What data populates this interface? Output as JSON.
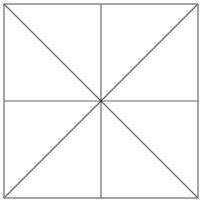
{
  "diagram": {
    "type": "square-subdivision",
    "canvas": {
      "width": 207,
      "height": 205,
      "background": "#ffffff"
    },
    "square": {
      "x": 4,
      "y": 4,
      "size": 194
    },
    "center": {
      "x": 101,
      "y": 101
    },
    "stroke_color": "#6a6a6a",
    "stroke_width": 1.2,
    "lines": [
      {
        "name": "diagonal-tl-br",
        "x1": 4,
        "y1": 4,
        "x2": 198,
        "y2": 198
      },
      {
        "name": "diagonal-tr-bl",
        "x1": 198,
        "y1": 4,
        "x2": 4,
        "y2": 198
      },
      {
        "name": "vertical-midline",
        "x1": 101,
        "y1": 4,
        "x2": 101,
        "y2": 198
      },
      {
        "name": "horizontal-midline",
        "x1": 4,
        "y1": 101,
        "x2": 198,
        "y2": 101
      }
    ]
  }
}
